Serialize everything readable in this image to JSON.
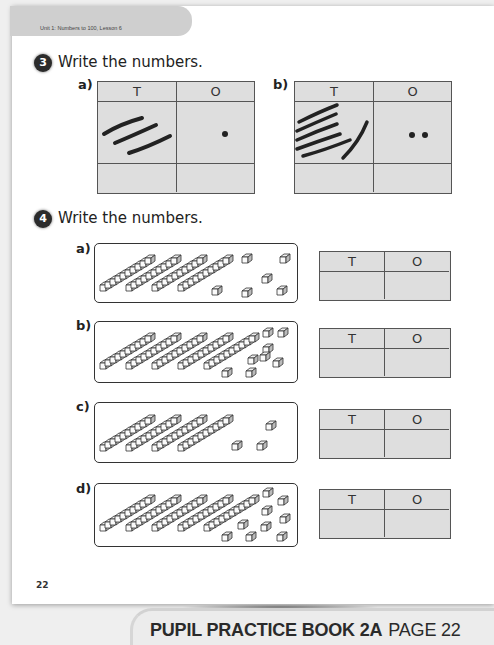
{
  "header": {
    "unit_text": "Unit 1: Numbers to 100, Lesson 6"
  },
  "question3": {
    "number": "3",
    "title": "Write the numbers.",
    "parts": [
      {
        "label": "a)",
        "col_tens": "T",
        "col_ones": "O",
        "tens_strokes": 3,
        "ones_dots": 1,
        "answer_tens": "",
        "answer_ones": ""
      },
      {
        "label": "b)",
        "col_tens": "T",
        "col_ones": "O",
        "tens_strokes": 6,
        "ones_dots": 2,
        "answer_tens": "",
        "answer_ones": ""
      }
    ]
  },
  "question4": {
    "number": "4",
    "title": "Write the numbers.",
    "parts": [
      {
        "label": "a)",
        "tens_rods": 4,
        "ones_cubes": 6,
        "col_tens": "T",
        "col_ones": "O",
        "answer_tens": "",
        "answer_ones": ""
      },
      {
        "label": "b)",
        "tens_rods": 5,
        "ones_cubes": 8,
        "col_tens": "T",
        "col_ones": "O",
        "answer_tens": "",
        "answer_ones": ""
      },
      {
        "label": "c)",
        "tens_rods": 4,
        "ones_cubes": 3,
        "col_tens": "T",
        "col_ones": "O",
        "answer_tens": "",
        "answer_ones": ""
      },
      {
        "label": "d)",
        "tens_rods": 5,
        "ones_cubes": 9,
        "col_tens": "T",
        "col_ones": "O",
        "answer_tens": "",
        "answer_ones": ""
      }
    ]
  },
  "footer": {
    "page_number": "22",
    "book_title": "PUPIL PRACTICE BOOK 2A",
    "page_label": "PAGE 22"
  }
}
